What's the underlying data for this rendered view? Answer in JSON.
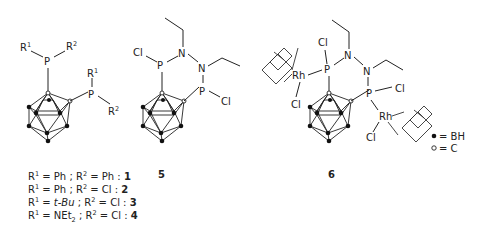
{
  "compounds": [
    {
      "id": "1-4",
      "labels": {
        "p1": "P",
        "p2": "P",
        "r1a": "R",
        "r1a_sup": "1",
        "r2a": "R",
        "r2a_sup": "2",
        "r1b": "R",
        "r1b_sup": "1",
        "r2b": "R",
        "r2b_sup": "2"
      },
      "substituents": [
        {
          "r1": "Ph",
          "r2": "Ph",
          "number": "1"
        },
        {
          "r1": "Ph",
          "r2": "Cl",
          "number": "2"
        },
        {
          "r1": "t-Bu",
          "r2": "Cl",
          "number": "3"
        },
        {
          "r1": "NEt",
          "r1_sub": "2",
          "r2": "Cl",
          "number": "4"
        }
      ]
    },
    {
      "id": "5",
      "labels": {
        "cl1": "Cl",
        "p1": "P",
        "n1": "N",
        "n2": "N",
        "p2": "P",
        "cl2": "Cl"
      },
      "number": "5"
    },
    {
      "id": "6",
      "labels": {
        "cl1": "Cl",
        "p1": "P",
        "n1": "N",
        "n2": "N",
        "p2": "P",
        "cl2": "Cl",
        "rh1": "Rh",
        "rh2": "Rh",
        "rhcl1": "Cl",
        "rhcl2": "Cl"
      },
      "number": "6"
    }
  ],
  "caption_text": {
    "r1_prefix": "R",
    "r1_sup": "1",
    "eq": " = ",
    "sep": " ; ",
    "r2_prefix": "R",
    "r2_sup": "2",
    "colon": " : "
  },
  "legend": {
    "filled": "= BH",
    "open": "= C"
  }
}
